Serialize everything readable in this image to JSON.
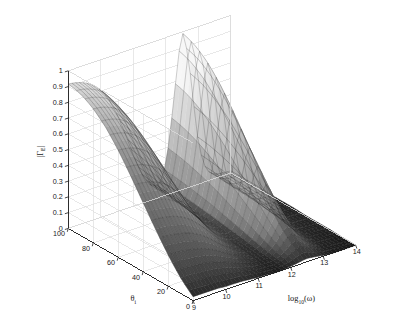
{
  "figure": {
    "title": "",
    "background_color": "#ffffff",
    "style": "matlab-surf-3d-grayscale"
  },
  "chart_data": {
    "type": "surface",
    "title": "",
    "xlabel": "log10(w)",
    "xlabel_base": "log",
    "xlabel_sub": "10",
    "xlabel_arg": "(ω)",
    "ylabel": "θi",
    "ylabel_base": "θ",
    "ylabel_sub": "i",
    "zlabel": "|ΓE|",
    "zlabel_base": "|Γ",
    "zlabel_sub": "E",
    "zlabel_tail": "|",
    "grid": true,
    "legend": null,
    "xlim": [
      9,
      14
    ],
    "ylim": [
      0,
      100
    ],
    "zlim": [
      0,
      1
    ],
    "xticks": [
      9,
      10,
      11,
      12,
      13,
      14
    ],
    "xticklabels": [
      "9",
      "10",
      "11",
      "12",
      "13",
      "14"
    ],
    "yticks": [
      0,
      20,
      40,
      60,
      80,
      100
    ],
    "yticklabels": [
      "0",
      "20",
      "40",
      "60",
      "80",
      "100"
    ],
    "zticks": [
      0,
      0.1,
      0.2,
      0.3,
      0.4,
      0.5,
      0.6,
      0.7,
      0.8,
      0.9,
      1
    ],
    "zticklabels": [
      "0",
      "0.1",
      "0.2",
      "0.3",
      "0.4",
      "0.5",
      "0.6",
      "0.7",
      "0.8",
      "0.9",
      "1"
    ],
    "view": {
      "azimuth": -37.5,
      "elevation": 30
    },
    "colormap": "gray",
    "shading": "faceted",
    "surface_description": "Two-ridge reflection-coefficient surface: a broad high ridge at low log10(w) values that decays with increasing theta, and a tall narrow peak near log10(w) = 12.5 rising to ~1.0, separated by a dark low valley near log10(w) = 11-12, with a flat near-zero plateau at high log10(w).",
    "features": [
      {
        "name": "left-ridge",
        "x": 9.0,
        "y": 100,
        "z": 0.92
      },
      {
        "name": "left-ridge-front",
        "x": 9.0,
        "y": 0,
        "z": 0.05
      },
      {
        "name": "valley-minimum",
        "x": 11.6,
        "y": 50,
        "z": 0.06
      },
      {
        "name": "right-peak",
        "x": 12.5,
        "y": 100,
        "z": 1.0
      },
      {
        "name": "right-peak-front",
        "x": 12.5,
        "y": 0,
        "z": 0.1
      },
      {
        "name": "high-freq-plateau",
        "x": 14.0,
        "y": 50,
        "z": 0.02
      }
    ],
    "surface_values": {
      "y_values": [
        100,
        90,
        80,
        70,
        60,
        50,
        40,
        30,
        20,
        10,
        0
      ],
      "x_values": [
        9.0,
        9.25,
        9.5,
        9.75,
        10.0,
        10.25,
        10.5,
        10.75,
        11.0,
        11.25,
        11.5,
        11.75,
        12.0,
        12.25,
        12.5,
        12.75,
        13.0,
        13.25,
        13.5,
        13.75,
        14.0
      ],
      "z_rows": [
        [
          0.92,
          0.92,
          0.91,
          0.9,
          0.88,
          0.84,
          0.77,
          0.64,
          0.45,
          0.26,
          0.14,
          0.12,
          0.22,
          0.55,
          1.0,
          0.72,
          0.3,
          0.12,
          0.06,
          0.04,
          0.03
        ],
        [
          0.9,
          0.9,
          0.89,
          0.88,
          0.85,
          0.81,
          0.73,
          0.6,
          0.42,
          0.24,
          0.13,
          0.11,
          0.2,
          0.51,
          0.95,
          0.68,
          0.28,
          0.11,
          0.06,
          0.04,
          0.03
        ],
        [
          0.86,
          0.86,
          0.85,
          0.84,
          0.81,
          0.76,
          0.68,
          0.55,
          0.38,
          0.22,
          0.12,
          0.1,
          0.18,
          0.46,
          0.88,
          0.62,
          0.25,
          0.1,
          0.05,
          0.03,
          0.03
        ],
        [
          0.8,
          0.8,
          0.79,
          0.77,
          0.74,
          0.69,
          0.61,
          0.49,
          0.33,
          0.19,
          0.11,
          0.09,
          0.16,
          0.4,
          0.78,
          0.55,
          0.22,
          0.09,
          0.05,
          0.03,
          0.02
        ],
        [
          0.71,
          0.71,
          0.7,
          0.68,
          0.65,
          0.6,
          0.53,
          0.42,
          0.28,
          0.16,
          0.09,
          0.08,
          0.14,
          0.34,
          0.66,
          0.46,
          0.18,
          0.08,
          0.04,
          0.03,
          0.02
        ],
        [
          0.6,
          0.6,
          0.59,
          0.57,
          0.55,
          0.5,
          0.44,
          0.34,
          0.23,
          0.13,
          0.08,
          0.07,
          0.11,
          0.27,
          0.53,
          0.37,
          0.15,
          0.06,
          0.03,
          0.02,
          0.02
        ],
        [
          0.48,
          0.48,
          0.47,
          0.46,
          0.43,
          0.4,
          0.34,
          0.27,
          0.18,
          0.1,
          0.06,
          0.05,
          0.09,
          0.21,
          0.41,
          0.28,
          0.11,
          0.05,
          0.03,
          0.02,
          0.01
        ],
        [
          0.36,
          0.36,
          0.35,
          0.34,
          0.32,
          0.29,
          0.25,
          0.19,
          0.13,
          0.07,
          0.04,
          0.04,
          0.06,
          0.15,
          0.29,
          0.2,
          0.08,
          0.03,
          0.02,
          0.01,
          0.01
        ],
        [
          0.24,
          0.24,
          0.23,
          0.22,
          0.21,
          0.19,
          0.16,
          0.12,
          0.08,
          0.05,
          0.03,
          0.02,
          0.04,
          0.09,
          0.18,
          0.12,
          0.05,
          0.02,
          0.01,
          0.01,
          0.01
        ],
        [
          0.13,
          0.13,
          0.12,
          0.12,
          0.11,
          0.1,
          0.08,
          0.06,
          0.04,
          0.02,
          0.01,
          0.01,
          0.02,
          0.05,
          0.09,
          0.06,
          0.03,
          0.01,
          0.01,
          0.0,
          0.0
        ],
        [
          0.04,
          0.04,
          0.04,
          0.04,
          0.03,
          0.03,
          0.03,
          0.02,
          0.01,
          0.01,
          0.0,
          0.0,
          0.01,
          0.02,
          0.03,
          0.02,
          0.01,
          0.0,
          0.0,
          0.0,
          0.0
        ]
      ]
    },
    "colors": {
      "axis_line": "#1a1a1a",
      "grid_line": "#d9d9d9",
      "surface_light": "#e8e8e8",
      "surface_dark": "#1c1c1c",
      "mesh_line": "#222222",
      "text": "#1a1a1a",
      "background": "#ffffff"
    }
  }
}
